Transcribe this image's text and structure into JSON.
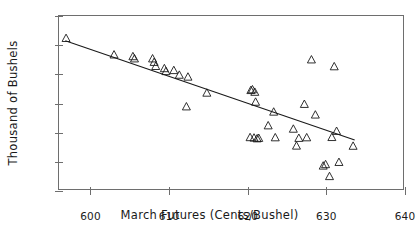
{
  "chart_data": {
    "type": "scatter",
    "title": "",
    "subtitle": "",
    "xlabel": "March Futures (Cents/Bushel)",
    "ylabel": "Thousand of Bushels",
    "xlim": [
      596,
      640
    ],
    "ylim": [
      -1800,
      -600
    ],
    "xticks": [
      600,
      610,
      620,
      630,
      640
    ],
    "yticks": [
      -600,
      -800,
      -1000,
      -1200,
      -1400,
      -1600,
      -1800
    ],
    "xtick_labels": [
      "600",
      "610",
      "620",
      "630",
      "640"
    ],
    "ytick_labels": [
      "-600",
      "-800",
      "-1000",
      "-1200",
      "-1400",
      "-1600",
      "-1800"
    ],
    "grid": false,
    "legend": null,
    "marker": "open-triangle",
    "marker_color": "#1a1a1a",
    "line_color": "#1a1a1a",
    "frame_color": "#6e6e6e",
    "background": "#ffffff",
    "series": [
      {
        "name": "observations",
        "marker": "triangle-up-open",
        "x": [
          596.9,
          603.0,
          605.4,
          605.6,
          607.9,
          608.1,
          608.3,
          609.4,
          609.6,
          610.6,
          611.3,
          612.2,
          612.4,
          614.8,
          620.4,
          620.6,
          620.9,
          621.0,
          620.3,
          620.8,
          621.2,
          621.4,
          622.6,
          623.3,
          623.5,
          625.8,
          626.2,
          626.5,
          627.2,
          627.5,
          628.1,
          628.6,
          629.6,
          629.9,
          630.4,
          630.7,
          631.0,
          631.3,
          631.6,
          633.4
        ],
        "y": [
          -753,
          -866,
          -878,
          -893,
          -893,
          -917,
          -945,
          -960,
          -980,
          -973,
          -1005,
          -1222,
          -1018,
          -1128,
          -1110,
          -1105,
          -1122,
          -1190,
          -1433,
          -1436,
          -1441,
          -1438,
          -1352,
          -1258,
          -1434,
          -1375,
          -1491,
          -1438,
          -1205,
          -1434,
          -900,
          -1278,
          -1628,
          -1618,
          -1700,
          -1432,
          -947,
          -1390,
          -1603,
          -1492
        ]
      }
    ],
    "fit_line": {
      "name": "linear-fit",
      "x": [
        596.8,
        633.6
      ],
      "y": [
        -770,
        -1450
      ]
    }
  },
  "axis": {
    "x_title": "March Futures (Cents/Bushel)",
    "y_title": "Thousand of Bushels"
  }
}
